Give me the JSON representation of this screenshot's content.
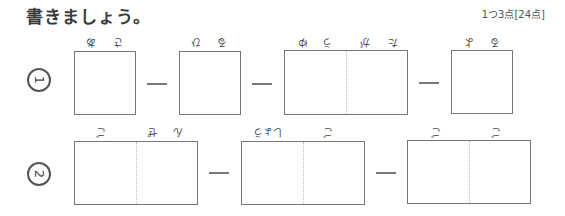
{
  "title": "書きましょう。",
  "score": "1つ3点[24点]",
  "rows": [
    {
      "number": "1",
      "boxes": [
        {
          "label_chars": [
            "あ",
            "さ"
          ]
        },
        {
          "label_chars": [
            "ひ",
            "る"
          ]
        },
        {
          "label_chars": [
            "ゆ",
            "う",
            "が",
            "た"
          ]
        },
        {
          "label_chars": [
            "よ",
            "る"
          ]
        }
      ]
    },
    {
      "number": "2",
      "boxes": [
        {
          "label_chars": [
            "ご",
            "ぜ",
            "ん"
          ]
        },
        {
          "label_chars": [
            "しょう",
            "ご"
          ]
        },
        {
          "label_chars": [
            "ご",
            "ご"
          ]
        }
      ]
    }
  ]
}
